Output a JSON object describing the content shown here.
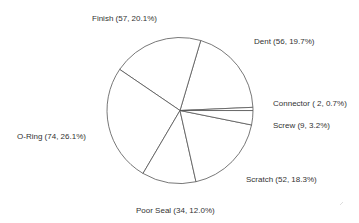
{
  "chart_data": {
    "type": "pie",
    "title": "",
    "categories": [
      "Dent",
      "Finish",
      "O-Ring",
      "Poor Seal",
      "Scratch",
      "Screw",
      "Connector"
    ],
    "values": [
      56,
      57,
      74,
      34,
      52,
      9,
      2
    ],
    "percentages": [
      19.7,
      20.1,
      26.1,
      12.0,
      18.3,
      3.2,
      0.7
    ],
    "labels": [
      "Dent    (56, 19.7%)",
      "Finish    (57, 20.1%)",
      "O-Ring    (74, 26.1%)",
      "Poor Seal (34, 12.0%)",
      "Scratch    (52, 18.3%)",
      "Screw    (9,  3.2%)",
      "Connector ( 2,  0.7%)"
    ],
    "legend": "none",
    "start_angle_deg": 2.5,
    "direction": "counterclockwise",
    "colors": {
      "fill": "#ffffff",
      "edge": "#555555",
      "text": "#333333"
    }
  }
}
